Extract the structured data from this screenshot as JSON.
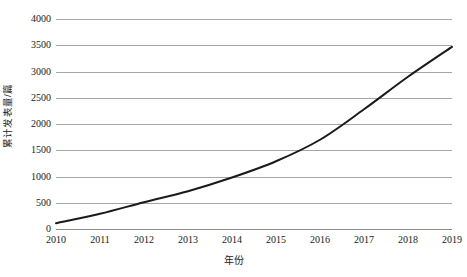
{
  "chart_data": {
    "type": "line",
    "title": "",
    "subtitle": "",
    "xlabel": "年份",
    "ylabel": "累计发表量/篇",
    "x": [
      2010,
      2011,
      2012,
      2013,
      2014,
      2015,
      2016,
      2017,
      2018,
      2019
    ],
    "xtick_labels": [
      "2010",
      "2011",
      "2012",
      "2013",
      "2014",
      "2015",
      "2016",
      "2017",
      "2018",
      "2019"
    ],
    "ytick_labels": [
      "4000",
      "3500",
      "3000",
      "2500",
      "2000",
      "1500",
      "1000",
      "500",
      "0"
    ],
    "ytick_values": [
      4000,
      3500,
      3000,
      2500,
      2000,
      1500,
      1000,
      500,
      0
    ],
    "ylim": [
      0,
      4000
    ],
    "xlim": [
      2010,
      2019
    ],
    "grid": "horizontal",
    "legend": "none",
    "series": [
      {
        "name": "累计发表量",
        "color": "#1a1a1a",
        "line_width": 2,
        "markers": "none",
        "values": [
          110,
          290,
          510,
          720,
          980,
          1290,
          1700,
          2280,
          2900,
          3470
        ]
      }
    ],
    "colors": {
      "line": "#1a1a1a",
      "gridline": "#a6a6a6",
      "baseline": "#8c8c8c",
      "text": "#1a1a1a",
      "background": "#ffffff"
    }
  }
}
